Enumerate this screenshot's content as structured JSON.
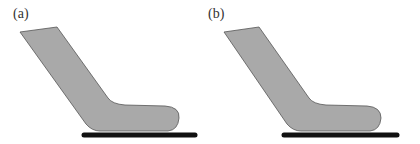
{
  "figure": {
    "panels": [
      {
        "label": "(a)",
        "shape": "bent-rod-contact",
        "fill": "#a9a9a9",
        "stroke": "#555555",
        "surface_color": "#111111"
      },
      {
        "label": "(b)",
        "shape": "bent-rod-contact",
        "fill": "#a9a9a9",
        "stroke": "#555555",
        "surface_color": "#111111"
      }
    ]
  }
}
